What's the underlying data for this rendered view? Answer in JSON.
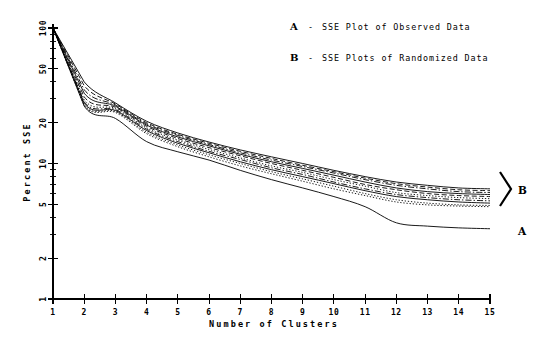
{
  "chart_data": {
    "type": "line",
    "title": "",
    "xlabel": "Number of Clusters",
    "ylabel": "Percent SSE",
    "xlim": [
      1,
      15
    ],
    "ylim": [
      1,
      100
    ],
    "yscale": "log",
    "grid": false,
    "legend_position": "top-right",
    "x": [
      1,
      2,
      3,
      4,
      5,
      6,
      7,
      8,
      9,
      10,
      11,
      12,
      13,
      14,
      15
    ],
    "xticklabels": [
      "1",
      "2",
      "3",
      "4",
      "5",
      "6",
      "7",
      "8",
      "9",
      "10",
      "11",
      "12",
      "13",
      "14",
      "15"
    ],
    "yticklabels": [
      "100",
      "50",
      "20",
      "10",
      "5",
      "2",
      "1"
    ],
    "ytickvalues": [
      100,
      50,
      20,
      10,
      5,
      2,
      1
    ],
    "yminorvalues": [
      90,
      80,
      70,
      60,
      40,
      30,
      9,
      8,
      7,
      6,
      4,
      3
    ],
    "annotations": [
      {
        "text": "A",
        "x": 15,
        "y": 3.3,
        "note": "observed data curve label"
      },
      {
        "text": "B",
        "x": 15,
        "y": 5.6,
        "note": "randomized data bundle label"
      }
    ],
    "legend": [
      {
        "key": "A",
        "dash": "-",
        "label": "SSE Plot of Observed Data"
      },
      {
        "key": "B",
        "dash": "-",
        "label": "SSE Plots of Randomized Data"
      }
    ],
    "series": [
      {
        "name": "SSE Plot of Observed Data",
        "group": "A",
        "style": "solid",
        "values": [
          100,
          26.5,
          21.5,
          14.5,
          12.2,
          10.6,
          8.9,
          7.6,
          6.6,
          5.7,
          4.8,
          3.65,
          3.45,
          3.35,
          3.3
        ]
      },
      {
        "name": "Randomized Data 1",
        "group": "B",
        "style": "solid",
        "values": [
          100,
          40.0,
          28.0,
          20.5,
          16.8,
          14.4,
          12.6,
          11.2,
          10.0,
          8.9,
          8.0,
          7.3,
          6.9,
          6.6,
          6.5
        ]
      },
      {
        "name": "Randomized Data 2",
        "group": "B",
        "style": "dash",
        "values": [
          100,
          37.5,
          27.5,
          20.0,
          16.4,
          14.1,
          12.3,
          10.9,
          9.7,
          8.7,
          7.8,
          7.1,
          6.7,
          6.4,
          6.3
        ]
      },
      {
        "name": "Randomized Data 3",
        "group": "B",
        "style": "dashdot",
        "values": [
          100,
          35.0,
          27.0,
          19.6,
          16.1,
          13.8,
          12.0,
          10.6,
          9.5,
          8.5,
          7.6,
          6.9,
          6.5,
          6.2,
          6.1
        ]
      },
      {
        "name": "Randomized Data 4",
        "group": "B",
        "style": "solid",
        "values": [
          100,
          33.0,
          26.5,
          19.2,
          15.7,
          13.5,
          11.7,
          10.3,
          9.2,
          8.2,
          7.3,
          6.6,
          6.2,
          6.0,
          5.9
        ]
      },
      {
        "name": "Randomized Data 5",
        "group": "B",
        "style": "dash",
        "values": [
          100,
          31.0,
          26.0,
          18.8,
          15.3,
          13.1,
          11.4,
          10.0,
          8.9,
          7.9,
          7.0,
          6.4,
          6.0,
          5.8,
          5.7
        ]
      },
      {
        "name": "Randomized Data 6",
        "group": "B",
        "style": "dot",
        "values": [
          100,
          29.5,
          25.5,
          18.3,
          14.9,
          12.7,
          11.0,
          9.6,
          8.6,
          7.6,
          6.8,
          6.1,
          5.8,
          5.6,
          5.5
        ]
      },
      {
        "name": "Randomized Data 7",
        "group": "B",
        "style": "dashdot",
        "values": [
          100,
          28.5,
          25.0,
          17.9,
          14.5,
          12.3,
          10.7,
          9.3,
          8.3,
          7.3,
          6.5,
          5.9,
          5.6,
          5.4,
          5.3
        ]
      },
      {
        "name": "Randomized Data 8",
        "group": "B",
        "style": "solid",
        "values": [
          100,
          27.8,
          24.6,
          17.5,
          14.1,
          12.0,
          10.3,
          9.0,
          8.0,
          7.1,
          6.3,
          5.7,
          5.4,
          5.2,
          5.1
        ]
      },
      {
        "name": "Randomized Data 9",
        "group": "B",
        "style": "dot",
        "values": [
          100,
          27.2,
          24.2,
          17.0,
          13.7,
          11.6,
          10.0,
          8.7,
          7.7,
          6.8,
          6.0,
          5.4,
          5.1,
          4.95,
          4.9
        ]
      },
      {
        "name": "Randomized Data 10",
        "group": "B",
        "style": "dot",
        "values": [
          100,
          26.8,
          23.8,
          16.6,
          13.3,
          11.2,
          9.6,
          8.4,
          7.4,
          6.5,
          5.8,
          5.2,
          4.95,
          4.85,
          4.8
        ]
      }
    ]
  },
  "legend": {
    "entry_a_key": "A",
    "entry_a_dash": "-",
    "entry_a_label": "SSE Plot of Observed Data",
    "entry_b_key": "B",
    "entry_b_dash": "-",
    "entry_b_label": "SSE Plots of Randomized Data"
  },
  "axes": {
    "x_title": "Number of Clusters",
    "y_title": "Percent SSE"
  },
  "callouts": {
    "label_a": "A",
    "label_b": "B"
  },
  "colors": {
    "ink": "#000000",
    "background": "#ffffff"
  }
}
